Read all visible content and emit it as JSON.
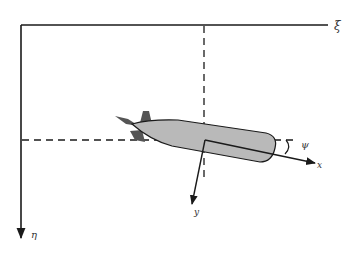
{
  "figure": {
    "axes": {
      "earth_horizontal_label": "ξ",
      "earth_vertical_label": "η",
      "body_longitudinal_label": "x",
      "body_lateral_label": "y",
      "heading_angle_label": "ψ"
    },
    "colors": {
      "line": "#1a1a1a",
      "hull_fill": "#b9b9b9",
      "fin_fill": "#555555",
      "background": "#ffffff"
    }
  }
}
